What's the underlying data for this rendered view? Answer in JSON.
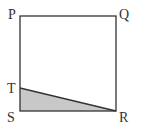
{
  "diagram": {
    "type": "geometry-figure",
    "labels": {
      "p": "P",
      "q": "Q",
      "r": "R",
      "s": "S",
      "t": "T"
    },
    "points": {
      "P": [
        20,
        16
      ],
      "Q": [
        116,
        16
      ],
      "R": [
        116,
        111
      ],
      "S": [
        20,
        111
      ],
      "T": [
        20,
        88
      ]
    },
    "shaded_region": [
      "T",
      "S",
      "R"
    ],
    "colors": {
      "stroke": "#333333",
      "shade": "#c8c8c8",
      "background": "#ffffff"
    }
  }
}
